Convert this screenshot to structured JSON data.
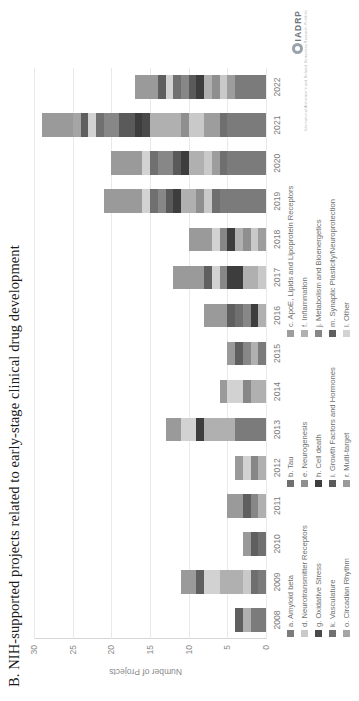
{
  "figure": {
    "title": "B. NIH-supported projects related to early-stage clinical drug development",
    "logo_text": "IADRP",
    "logo_sub": "International Alzheimer's and Related Dementias Research Portfolio"
  },
  "chart_data": {
    "type": "bar",
    "subtype": "stacked-bar",
    "orientation": "vertical",
    "title": "B. NIH-supported projects related to early-stage clinical drug development",
    "xlabel": "",
    "ylabel": "Number of Projects",
    "ylim": [
      0,
      30
    ],
    "yticks": [
      0,
      5,
      10,
      15,
      20,
      25,
      30
    ],
    "grid": "y-major-only",
    "legend_position": "below",
    "categories": [
      "2008",
      "2009",
      "2010",
      "2011",
      "2012",
      "2013",
      "2014",
      "2015",
      "2016",
      "2017",
      "2018",
      "2019",
      "2020",
      "2021",
      "2022"
    ],
    "series": [
      {
        "name": "a. Amyloid beta",
        "color": "#7b7b7b",
        "values": [
          2,
          1,
          0,
          0,
          0,
          4,
          0,
          1,
          0,
          0,
          0,
          6,
          5,
          5,
          4
        ]
      },
      {
        "name": "b. Tau",
        "color": "#6f6f6f",
        "values": [
          0,
          1,
          0,
          0,
          0,
          0,
          0,
          0,
          0,
          0,
          0,
          1,
          1,
          1,
          0
        ]
      },
      {
        "name": "c. ApoE, Lipids and Lipoprotein Receptors",
        "color": "#9d9d9d",
        "values": [
          0,
          0,
          0,
          0,
          0,
          0,
          0,
          0,
          0,
          0,
          1,
          0,
          1,
          2,
          1
        ]
      },
      {
        "name": "d. Neurotransmitter Receptors",
        "color": "#c9c9c9",
        "values": [
          0,
          1,
          0,
          0,
          0,
          0,
          0,
          0,
          0,
          1,
          1,
          1,
          1,
          2,
          1
        ]
      },
      {
        "name": "e. Neurogenesis",
        "color": "#8f8f8f",
        "values": [
          0,
          0,
          0,
          0,
          0,
          0,
          0,
          0,
          0,
          0,
          1,
          1,
          0,
          1,
          1
        ]
      },
      {
        "name": "f. Inflammation",
        "color": "#b0b0b0",
        "values": [
          1,
          3,
          0,
          1,
          1,
          4,
          2,
          1,
          1,
          2,
          1,
          2,
          2,
          4,
          1
        ]
      },
      {
        "name": "g. Oxidative Stress",
        "color": "#4a4a4a",
        "values": [
          0,
          0,
          0,
          0,
          0,
          0,
          0,
          0,
          0,
          0,
          0,
          0,
          0,
          1,
          0
        ]
      },
      {
        "name": "h. Cell death",
        "color": "#3d3d3d",
        "values": [
          0,
          0,
          0,
          0,
          0,
          1,
          0,
          0,
          1,
          2,
          1,
          1,
          1,
          1,
          1
        ]
      },
      {
        "name": "i. Growth Factors and Hormones",
        "color": "#5a5a5a",
        "values": [
          0,
          0,
          0,
          0,
          0,
          0,
          0,
          0,
          0,
          0,
          0,
          1,
          1,
          2,
          1
        ]
      },
      {
        "name": "j. Metabolism and Bioenergetics",
        "color": "#878787",
        "values": [
          0,
          0,
          0,
          1,
          1,
          0,
          1,
          1,
          1,
          1,
          1,
          1,
          2,
          2,
          1
        ]
      },
      {
        "name": "k. Vasculature",
        "color": "#707070",
        "values": [
          0,
          0,
          1,
          0,
          0,
          0,
          0,
          0,
          1,
          0,
          0,
          1,
          1,
          1,
          1
        ]
      },
      {
        "name": "l. Other",
        "color": "#d2d2d2",
        "values": [
          0,
          2,
          0,
          0,
          1,
          2,
          2,
          0,
          0,
          1,
          1,
          1,
          1,
          1,
          1
        ]
      },
      {
        "name": "m. Synaptic Plasticity/Neuroprotection",
        "color": "#5f5f5f",
        "values": [
          1,
          1,
          1,
          1,
          0,
          0,
          0,
          1,
          1,
          1,
          0,
          0,
          0,
          1,
          1
        ]
      },
      {
        "name": "o. Circadian Rhythm",
        "color": "#a5a5a5",
        "values": [
          0,
          0,
          0,
          0,
          0,
          0,
          0,
          0,
          0,
          0,
          0,
          0,
          0,
          1,
          0
        ]
      },
      {
        "name": "r. Multi-target",
        "color": "#9a9a9a",
        "values": [
          0,
          2,
          1,
          2,
          1,
          2,
          1,
          1,
          3,
          4,
          3,
          5,
          4,
          4,
          3
        ]
      }
    ],
    "totals": [
      4,
      11,
      3,
      5,
      4,
      13,
      6,
      5,
      8,
      12,
      10,
      21,
      20,
      29,
      16
    ]
  },
  "legend": {
    "columns": [
      [
        "a. Amyloid beta",
        "d. Neurotransmitter Receptors",
        "g. Oxidative Stress",
        "k. Vasculature",
        "o. Circadian Rhythm"
      ],
      [
        "b. Tau",
        "e. Neurogenesis",
        "h. Cell death",
        "i. Growth Factors and Hormones",
        "r. Multi-target"
      ],
      [
        "c. ApoE, Lipids and Lipoprotein Receptors",
        "f. Inflammation",
        "j. Metabolism and Bioenergetics",
        "m. Synaptic Plasticity/Neuroprotection",
        "l. Other"
      ]
    ],
    "colors": [
      [
        "#7b7b7b",
        "#c9c9c9",
        "#4a4a4a",
        "#707070",
        "#a5a5a5"
      ],
      [
        "#6f6f6f",
        "#8f8f8f",
        "#3d3d3d",
        "#5a5a5a",
        "#9a9a9a"
      ],
      [
        "#9d9d9d",
        "#b0b0b0",
        "#878787",
        "#5f5f5f",
        "#d2d2d2"
      ]
    ]
  },
  "axis": {
    "y_label": "Number of Projects",
    "y_ticks": [
      "30",
      "25",
      "20",
      "15",
      "10",
      "5",
      "0"
    ],
    "x_ticks": [
      "2008",
      "2009",
      "2010",
      "2011",
      "2012",
      "2013",
      "2014",
      "2015",
      "2016",
      "2017",
      "2018",
      "2019",
      "2020",
      "2021",
      "2022"
    ]
  }
}
